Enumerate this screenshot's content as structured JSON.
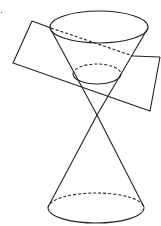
{
  "diagram": {
    "type": "double-cone-plane-section",
    "label": ".",
    "colors": {
      "line": "#222222",
      "background": "#ffffff"
    },
    "apex": {
      "x": 97,
      "y": 115
    },
    "top_ellipse": {
      "cx": 99,
      "cy": 27,
      "rx": 49,
      "ry": 16
    },
    "section_ellipse": {
      "cx": 97,
      "cy": 74,
      "rx": 24,
      "ry": 10
    },
    "bottom_ellipse": {
      "cx": 96,
      "cy": 208,
      "rx": 48,
      "ry": 15
    },
    "plane_corners": [
      [
        32,
        21
      ],
      [
        160,
        57
      ],
      [
        150,
        111
      ],
      [
        13,
        63
      ]
    ]
  }
}
